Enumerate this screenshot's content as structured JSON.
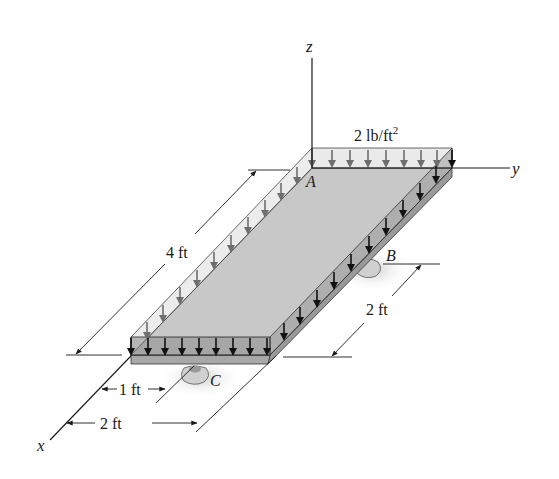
{
  "figure": {
    "axes": {
      "x": "x",
      "y": "y",
      "z": "z"
    },
    "points": {
      "A": "A",
      "B": "B",
      "C": "C"
    },
    "load": {
      "value": "2 lb/ft",
      "superscript": "2"
    },
    "dimensions": {
      "length_left": "4 ft",
      "support_B_offset": "2 ft",
      "support_C_offset": "1 ft",
      "width_front": "2 ft"
    }
  },
  "colors": {
    "plate_top": "#c8c8c8",
    "plate_side": "#9a9a9a",
    "load_band": "#e6e6e6",
    "arrow_grey": "#6e6e6e",
    "arrow_black": "#111111",
    "line": "#1a1a1a"
  }
}
